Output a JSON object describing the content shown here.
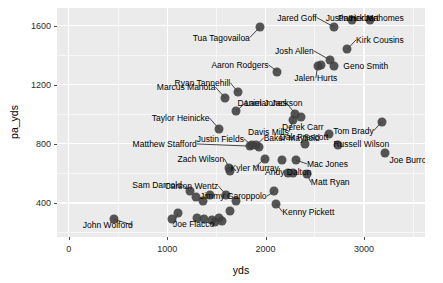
{
  "chart_data": {
    "type": "scatter",
    "title": "",
    "xlabel": "yds",
    "ylabel": "pa_yds",
    "xlim": [
      -120,
      3620
    ],
    "ylim": [
      170,
      1720
    ],
    "xticks": [
      0,
      1000,
      2000,
      3000
    ],
    "yticks": [
      400,
      800,
      1200,
      1600
    ],
    "xtick_labels": [
      "0",
      "1000",
      "2000",
      "3000"
    ],
    "ytick_labels": [
      "400",
      "800",
      "1200",
      "1600"
    ],
    "grid": true,
    "legend": "none",
    "panel_background": "#ebebeb",
    "gridline_color": "#ffffff",
    "point_color": "#3f3f3f",
    "points": [
      {
        "label": "Tua Tagovailoa",
        "x": 1940,
        "y": 1590,
        "lx": 1840,
        "ly": 1520,
        "anchor": "r"
      },
      {
        "label": "Jared Goff",
        "x": 2700,
        "y": 1590,
        "lx": 2520,
        "ly": 1655,
        "anchor": "r"
      },
      {
        "label": "Justin Herbert",
        "x": 2880,
        "y": 1640,
        "lx": 2880,
        "ly": 1650,
        "anchor": "c"
      },
      {
        "label": "Patrick Mahomes",
        "x": 3060,
        "y": 1640,
        "lx": 3070,
        "ly": 1650,
        "anchor": "c"
      },
      {
        "label": "Kirk Cousins",
        "x": 2830,
        "y": 1440,
        "lx": 2920,
        "ly": 1505,
        "anchor": "l"
      },
      {
        "label": "Josh Allen",
        "x": 2650,
        "y": 1370,
        "lx": 2490,
        "ly": 1430,
        "anchor": "r"
      },
      {
        "label": "Geno Smith",
        "x": 2700,
        "y": 1330,
        "lx": 2790,
        "ly": 1330,
        "anchor": "l"
      },
      {
        "label": "Jalen Hurts",
        "x": 2530,
        "y": 1330,
        "lx": 2510,
        "ly": 1245,
        "anchor": "c"
      },
      {
        "label": "Aaron Rodgers",
        "x": 2120,
        "y": 1290,
        "lx": 2030,
        "ly": 1335,
        "anchor": "r"
      },
      {
        "label": "Ryan Tannehill",
        "x": 1720,
        "y": 1150,
        "lx": 1640,
        "ly": 1215,
        "anchor": "r"
      },
      {
        "label": "Marcus Mariota",
        "x": 1590,
        "y": 1110,
        "lx": 1490,
        "ly": 1185,
        "anchor": "r"
      },
      {
        "label": "Lamar Jackson",
        "x": 1700,
        "y": 1020,
        "lx": 1790,
        "ly": 1075,
        "anchor": "l"
      },
      {
        "label": "Daniel Jones",
        "x": 2300,
        "y": 1005,
        "lx": 2215,
        "ly": 1075,
        "anchor": "r"
      },
      {
        "label": "Taylor Heinicke",
        "x": 1530,
        "y": 900,
        "lx": 1430,
        "ly": 975,
        "anchor": "r"
      },
      {
        "label": "Davis Mills",
        "x": 2280,
        "y": 960,
        "lx": 2235,
        "ly": 880,
        "anchor": "r"
      },
      {
        "label": "Derek Carr",
        "x": 2640,
        "y": 870,
        "lx": 2590,
        "ly": 915,
        "anchor": "r"
      },
      {
        "label": "Tom Brady",
        "x": 3180,
        "y": 950,
        "lx": 3100,
        "ly": 890,
        "anchor": "r"
      },
      {
        "label": "Justin Fields",
        "x": 1860,
        "y": 790,
        "lx": 1780,
        "ly": 835,
        "anchor": "r"
      },
      {
        "label": "Baker Mayfield",
        "x": 1900,
        "y": 790,
        "lx": 1980,
        "ly": 840,
        "anchor": "l"
      },
      {
        "label": "Matthew Stafford",
        "x": 1840,
        "y": 785,
        "lx": 1300,
        "ly": 800,
        "anchor": "r"
      },
      {
        "label": "Dak Prescott",
        "x": 2400,
        "y": 800,
        "lx": 2390,
        "ly": 845,
        "anchor": "c"
      },
      {
        "label": "Russell Wilson",
        "x": 2740,
        "y": 790,
        "lx": 2690,
        "ly": 800,
        "anchor": "l"
      },
      {
        "label": "Joe Burrow",
        "x": 3210,
        "y": 740,
        "lx": 3260,
        "ly": 690,
        "anchor": "l"
      },
      {
        "label": "Kyler Murray",
        "x": 1990,
        "y": 700,
        "lx": 1890,
        "ly": 640,
        "anchor": "c"
      },
      {
        "label": "Zach Wilson",
        "x": 1630,
        "y": 640,
        "lx": 1580,
        "ly": 700,
        "anchor": "r"
      },
      {
        "label": "Mac Jones",
        "x": 2310,
        "y": 690,
        "lx": 2420,
        "ly": 665,
        "anchor": "l"
      },
      {
        "label": "Andy Dalton",
        "x": 2230,
        "y": 605,
        "lx": 2230,
        "ly": 610,
        "anchor": "c"
      },
      {
        "label": "Matt Ryan",
        "x": 2420,
        "y": 595,
        "lx": 2460,
        "ly": 540,
        "anchor": "l"
      },
      {
        "label": "Carson Wentz",
        "x": 1600,
        "y": 455,
        "lx": 1520,
        "ly": 515,
        "anchor": "r"
      },
      {
        "label": "Sam Darnold",
        "x": 1230,
        "y": 480,
        "lx": 1150,
        "ly": 525,
        "anchor": "r"
      },
      {
        "label": "Jimmy Garoppolo",
        "x": 2090,
        "y": 480,
        "lx": 2010,
        "ly": 445,
        "anchor": "r"
      },
      {
        "label": "Kenny Pickett",
        "x": 2110,
        "y": 395,
        "lx": 2170,
        "ly": 340,
        "anchor": "l"
      },
      {
        "label": "Joe Flacco",
        "x": 1110,
        "y": 330,
        "lx": 1060,
        "ly": 255,
        "anchor": "l"
      },
      {
        "label": "John Wolford",
        "x": 460,
        "y": 290,
        "lx": 650,
        "ly": 250,
        "anchor": "r"
      }
    ],
    "unlabeled_points": [
      {
        "x": 2560,
        "y": 1335
      },
      {
        "x": 1440,
        "y": 455
      },
      {
        "x": 1290,
        "y": 440
      },
      {
        "x": 1360,
        "y": 415
      },
      {
        "x": 1700,
        "y": 415
      },
      {
        "x": 1640,
        "y": 345
      },
      {
        "x": 1300,
        "y": 300
      },
      {
        "x": 1370,
        "y": 290
      },
      {
        "x": 1460,
        "y": 285
      },
      {
        "x": 1530,
        "y": 300
      },
      {
        "x": 1490,
        "y": 270
      },
      {
        "x": 1560,
        "y": 275
      },
      {
        "x": 1050,
        "y": 290
      },
      {
        "x": 1640,
        "y": 620
      },
      {
        "x": 2170,
        "y": 690
      },
      {
        "x": 2360,
        "y": 985
      },
      {
        "x": 1930,
        "y": 780
      },
      {
        "x": 2280,
        "y": 600
      }
    ]
  }
}
